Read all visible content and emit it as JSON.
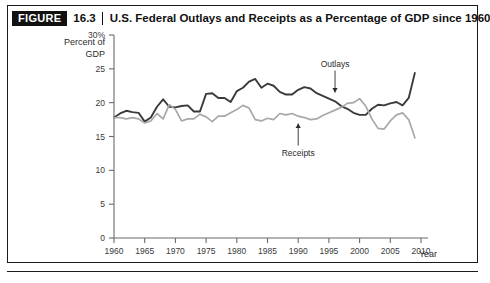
{
  "figure": {
    "badge_label": "FIGURE",
    "number": "16.3",
    "title": "U.S. Federal Outlays and Receipts as a Percentage of GDP since 1960"
  },
  "chart_data": {
    "type": "line",
    "title": "U.S. Federal Outlays and Receipts as a Percentage of GDP since 1960",
    "xlabel": "Year",
    "ylabel": "Percent of GDP",
    "ylabel_line1": "Percent of",
    "ylabel_line2": "GDP",
    "xlim": [
      1960,
      2010
    ],
    "ylim": [
      0,
      30
    ],
    "xticks": [
      1960,
      1965,
      1970,
      1975,
      1980,
      1985,
      1990,
      1995,
      2000,
      2005,
      2010
    ],
    "xtick_labels": [
      "1960",
      "1965",
      "1970",
      "1975",
      "1980",
      "1985",
      "1990",
      "1995",
      "2000",
      "2005",
      "2010"
    ],
    "yticks": [
      0,
      5,
      10,
      15,
      20,
      25,
      30
    ],
    "ytick_labels": [
      "0",
      "5",
      "10",
      "15",
      "20",
      "25",
      "30%"
    ],
    "grid": false,
    "legend_position": "annotations-inline",
    "annotations": [
      {
        "label": "Outlays",
        "points_to_year": 1996,
        "points_to_value": 20.6,
        "direction": "down",
        "color": "#3a3a3a"
      },
      {
        "label": "Receipts",
        "points_to_year": 1990,
        "points_to_value": 17.8,
        "direction": "up",
        "color": "#3a3a3a"
      }
    ],
    "x": [
      1960,
      1961,
      1962,
      1963,
      1964,
      1965,
      1966,
      1967,
      1968,
      1969,
      1970,
      1971,
      1972,
      1973,
      1974,
      1975,
      1976,
      1977,
      1978,
      1979,
      1980,
      1981,
      1982,
      1983,
      1984,
      1985,
      1986,
      1987,
      1988,
      1989,
      1990,
      1991,
      1992,
      1993,
      1994,
      1995,
      1996,
      1997,
      1998,
      1999,
      2000,
      2001,
      2002,
      2003,
      2004,
      2005,
      2006,
      2007,
      2008,
      2009
    ],
    "series": [
      {
        "name": "Outlays",
        "color": "#3a3a3a",
        "width": 1.9,
        "values": [
          17.8,
          18.4,
          18.8,
          18.6,
          18.5,
          17.2,
          17.8,
          19.4,
          20.5,
          19.4,
          19.3,
          19.5,
          19.6,
          18.7,
          18.7,
          21.3,
          21.4,
          20.7,
          20.7,
          20.1,
          21.7,
          22.2,
          23.1,
          23.5,
          22.2,
          22.8,
          22.5,
          21.6,
          21.2,
          21.2,
          21.9,
          22.3,
          22.1,
          21.4,
          21.0,
          20.6,
          20.2,
          19.5,
          19.1,
          18.5,
          18.2,
          18.2,
          19.1,
          19.7,
          19.6,
          19.9,
          20.1,
          19.6,
          20.7,
          24.4
        ]
      },
      {
        "name": "Receipts",
        "color": "#a8a8a8",
        "width": 1.7,
        "values": [
          17.8,
          17.8,
          17.6,
          17.8,
          17.6,
          17.0,
          17.3,
          18.4,
          17.6,
          19.7,
          19.0,
          17.3,
          17.6,
          17.6,
          18.3,
          17.9,
          17.2,
          18.0,
          18.0,
          18.5,
          19.0,
          19.6,
          19.2,
          17.5,
          17.3,
          17.7,
          17.5,
          18.4,
          18.2,
          18.4,
          18.0,
          17.8,
          17.5,
          17.6,
          18.1,
          18.5,
          18.9,
          19.3,
          19.9,
          20.0,
          20.6,
          19.5,
          17.6,
          16.2,
          16.1,
          17.3,
          18.2,
          18.5,
          17.5,
          14.8
        ]
      }
    ]
  }
}
